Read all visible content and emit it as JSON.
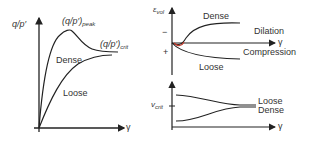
{
  "panels": {
    "stress_ratio": {
      "y_axis_label": "q/p′",
      "x_axis_label": "γ",
      "peak_label_main": "(q/p′)",
      "peak_label_sub": "peak",
      "crit_label_main": "(q/p′)",
      "crit_label_sub": "crit",
      "curves": [
        "Dense",
        "Loose"
      ]
    },
    "volumetric_strain": {
      "y_axis_label_main": "ε",
      "y_axis_label_sub": "vol",
      "x_axis_label": "γ",
      "minus_tick": "−",
      "plus_tick": "+",
      "curves": [
        "Dense",
        "Loose"
      ],
      "regions": {
        "upper": "Dilation",
        "lower": "Compression"
      }
    },
    "specific_volume": {
      "y_axis_label_main": "v",
      "y_axis_label_sub": "crit",
      "x_axis_label": "γ",
      "curves": [
        "Loose",
        "Dense"
      ]
    }
  },
  "colors": {
    "line": "#222222",
    "accent": "#c0392b"
  }
}
